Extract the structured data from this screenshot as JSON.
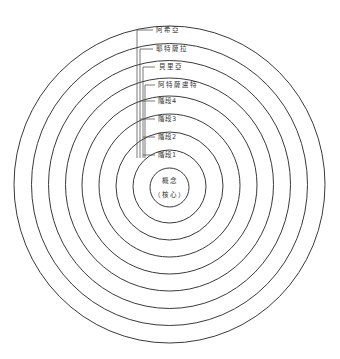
{
  "diagram": {
    "type": "concentric-circles",
    "stroke_color": "#3a3a3a",
    "background": "#ffffff",
    "ring_count": 9,
    "core": {
      "line1": "概念",
      "line2": "（核心）"
    },
    "levels": [
      {
        "label": "階段1"
      },
      {
        "label": "階段2"
      },
      {
        "label": "階段3"
      },
      {
        "label": "階段4"
      },
      {
        "label": "阿特薩盧特"
      },
      {
        "label": "貝里亞"
      },
      {
        "label": "耶特薩拉"
      },
      {
        "label": "阿希亞"
      }
    ]
  }
}
